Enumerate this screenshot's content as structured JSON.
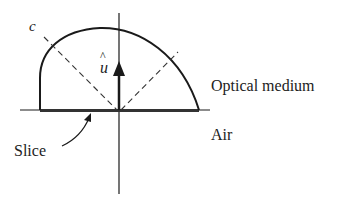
{
  "diagram": {
    "labels": {
      "curve_label": "c",
      "vector_label": "u",
      "vector_hat": "^",
      "upper_region": "Optical medium",
      "lower_region": "Air",
      "slice": "Slice"
    },
    "colors": {
      "stroke": "#1a1a1a",
      "dashed": "#333333",
      "background": "#ffffff"
    }
  }
}
